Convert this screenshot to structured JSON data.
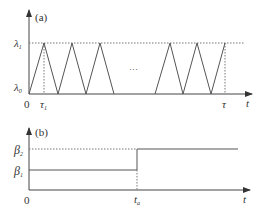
{
  "colors": {
    "line": "#555555",
    "dotted": "#777777",
    "text": "#333333",
    "background": "#ffffff"
  },
  "panel_a": {
    "label": "(a)",
    "y_labels": {
      "lambda1": "λ",
      "lambda1_sub": "1",
      "lambda0": "λ",
      "lambda0_sub": "0"
    },
    "x_labels": {
      "origin": "0",
      "tau1": "τ",
      "tau1_sub": "1",
      "tau": "τ",
      "t": "t"
    },
    "ellipsis": "···",
    "waveform": {
      "type": "triangular",
      "left_group_peaks": [
        44,
        72,
        100
      ],
      "right_group_peaks": [
        170,
        197,
        225
      ]
    }
  },
  "panel_b": {
    "label": "(b)",
    "y_labels": {
      "beta2": "β",
      "beta2_sub": "2",
      "beta1": "β",
      "beta1_sub": "1"
    },
    "x_labels": {
      "origin": "0",
      "ta": "t",
      "ta_sub": "a",
      "t": "t"
    },
    "waveform": {
      "type": "step",
      "from": "β1",
      "to": "β2",
      "at": "ta"
    }
  }
}
